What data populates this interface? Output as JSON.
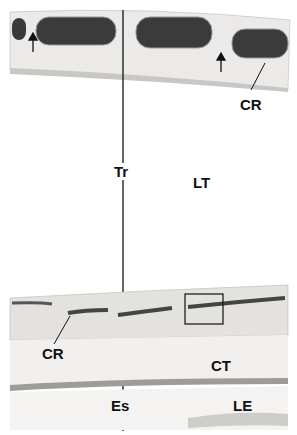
{
  "figure": {
    "labels": {
      "cr_top": "CR",
      "tr": "Tr",
      "lt": "LT",
      "cr_bottom": "CR",
      "ct": "CT",
      "es": "Es",
      "le": "LE"
    }
  }
}
